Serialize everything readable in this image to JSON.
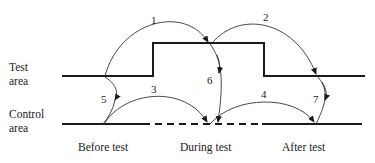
{
  "diagram": {
    "row_labels": {
      "test": [
        "Test",
        "area"
      ],
      "control": [
        "Control",
        "area"
      ]
    },
    "period_labels": [
      "Before test",
      "During test",
      "After test"
    ],
    "comparisons": [
      {
        "id": "1",
        "from": "Test area, before test",
        "to": "Test area, during test"
      },
      {
        "id": "2",
        "from": "Test area, during test",
        "to": "Test area, after test"
      },
      {
        "id": "3",
        "from": "Control area, before test",
        "to": "Control area, during test"
      },
      {
        "id": "4",
        "from": "Control area, during test",
        "to": "Control area, after test"
      },
      {
        "id": "5",
        "from": "Test area, before test",
        "to": "Control area, before test"
      },
      {
        "id": "6",
        "from": "Test area, during test",
        "to": "Control area, during test"
      },
      {
        "id": "7",
        "from": "Test area, after test",
        "to": "Control area, after test"
      }
    ],
    "colors": {
      "line": "#1a1a1a",
      "text": "#222222"
    }
  }
}
